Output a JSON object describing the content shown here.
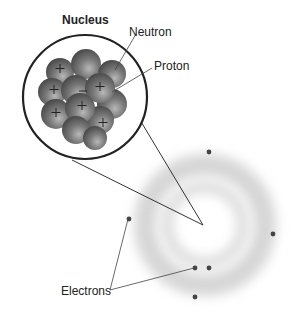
{
  "diagram": {
    "labels": {
      "nucleus": "Nucleus",
      "neutron": "Neutron",
      "proton": "Proton",
      "electrons": "Electrons"
    },
    "colors": {
      "particle": "#6e6e6e",
      "outline": "#222222",
      "cloud": "#cfcfcf",
      "electron": "#444444"
    },
    "electron_count": 6
  }
}
